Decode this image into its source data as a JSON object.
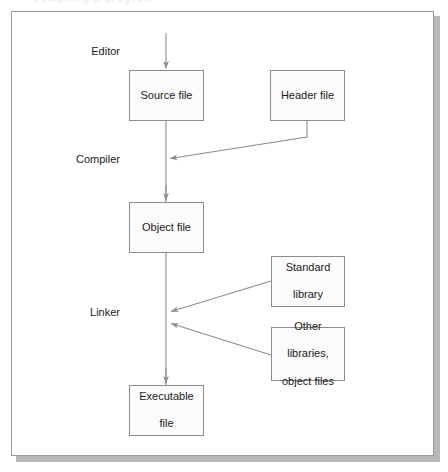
{
  "figure": {
    "partial_top_text": "compiling a program",
    "colors": {
      "box_border": "#8d8d8d",
      "box_fill": "#fbfbfb",
      "line": "#8d8d8d",
      "frame_border": "#9a9a9a",
      "shadow": "#b9b9b9",
      "text": "#1a1a1a",
      "background": "#ffffff"
    }
  },
  "stages": [
    {
      "id": "editor",
      "label": "Editor",
      "x": 120,
      "y": 52
    },
    {
      "id": "compiler",
      "label": "Compiler",
      "x": 120,
      "y": 160
    },
    {
      "id": "linker",
      "label": "Linker",
      "x": 120,
      "y": 313
    }
  ],
  "nodes": [
    {
      "id": "source-file",
      "lines": [
        "Source file"
      ],
      "x": 129,
      "y": 70,
      "w": 75,
      "h": 51
    },
    {
      "id": "header-file",
      "lines": [
        "Header file"
      ],
      "x": 270,
      "y": 70,
      "w": 75,
      "h": 51
    },
    {
      "id": "object-file",
      "lines": [
        "Object file"
      ],
      "x": 129,
      "y": 202,
      "w": 75,
      "h": 51
    },
    {
      "id": "standard-library",
      "lines": [
        "Standard",
        "library"
      ],
      "x": 271,
      "y": 256,
      "w": 74,
      "h": 51
    },
    {
      "id": "other-libraries",
      "lines": [
        "Other",
        "libraries,",
        "object files"
      ],
      "x": 271,
      "y": 327,
      "w": 74,
      "h": 54
    },
    {
      "id": "executable-file",
      "lines": [
        "Executable",
        "file"
      ],
      "x": 129,
      "y": 385,
      "w": 75,
      "h": 51
    }
  ],
  "connectors": [
    {
      "id": "editor-to-source",
      "from": "editor",
      "to": "source-file",
      "kind": "arrow-down"
    },
    {
      "id": "source-to-compiler",
      "from": "source-file",
      "to": "compiler",
      "kind": "line-down"
    },
    {
      "id": "header-to-compiler",
      "from": "header-file",
      "to": "compiler",
      "kind": "elbow-diagonal-arrow"
    },
    {
      "id": "compiler-to-object",
      "from": "compiler",
      "to": "object-file",
      "kind": "arrow-down"
    },
    {
      "id": "object-to-linker",
      "from": "object-file",
      "to": "linker",
      "kind": "line-down"
    },
    {
      "id": "standard-library-to-linker",
      "from": "standard-library",
      "to": "linker",
      "kind": "diagonal-arrow"
    },
    {
      "id": "other-libraries-to-linker",
      "from": "other-libraries",
      "to": "linker",
      "kind": "diagonal-arrow"
    },
    {
      "id": "linker-to-executable",
      "from": "linker",
      "to": "executable-file",
      "kind": "arrow-down"
    }
  ]
}
